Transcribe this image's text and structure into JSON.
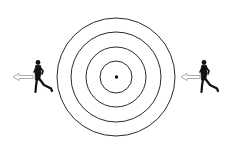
{
  "diagram": {
    "background": "#ffffff",
    "target": {
      "center": [
        116,
        77
      ],
      "radii": [
        59,
        45,
        30,
        16
      ],
      "dot_radius": 1.6,
      "stroke_color": "#2a2a2a"
    },
    "runners": [
      {
        "id": "left",
        "direction": "left",
        "color": "#111111"
      },
      {
        "id": "right",
        "direction": "left",
        "color": "#111111"
      }
    ],
    "arrows": [
      {
        "id": "left-arrow",
        "direction": "left",
        "outline_color": "#9a9a9a"
      },
      {
        "id": "right-arrow",
        "direction": "left",
        "outline_color": "#9a9a9a"
      }
    ]
  }
}
